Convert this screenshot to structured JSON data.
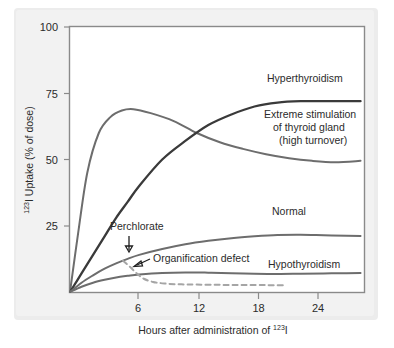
{
  "figure": {
    "background_color": "#f2f2f2",
    "plot_background_color": "#ffffff"
  },
  "chart_data": {
    "type": "line",
    "title": "",
    "xlabel_parts": {
      "pre": "Hours after administration of ",
      "sup": "123",
      "post": "I"
    },
    "ylabel_parts": {
      "sup": "123",
      "post": "I Uptake (% of dose)"
    },
    "xlabel": "Hours after administration of 123I",
    "ylabel": "123I Uptake (% of dose)",
    "xlim": [
      0,
      25.5
    ],
    "ylim": [
      0,
      100
    ],
    "xticks": [
      6,
      12,
      18,
      24
    ],
    "xtick_labels": [
      "6",
      "12",
      "18",
      "24"
    ],
    "yticks": [
      25,
      50,
      75,
      100
    ],
    "ytick_labels": [
      "25",
      "50",
      "75",
      "100"
    ],
    "grid": false,
    "legend": "inline-labels",
    "series": [
      {
        "name": "Hyperthyroidism",
        "label": "Hyperthyroidism",
        "color": "#3a3a3a",
        "style": "solid",
        "x": [
          0,
          1,
          2,
          3,
          4,
          5,
          6,
          8,
          10,
          12,
          14,
          16,
          18,
          20,
          22,
          24,
          25.2
        ],
        "values": [
          0,
          7,
          14,
          21,
          28,
          34,
          40,
          50,
          57,
          63,
          67,
          70,
          71.5,
          72,
          72,
          72,
          72
        ]
      },
      {
        "name": "Extreme stimulation of thyroid gland (high turnover)",
        "label_lines": [
          "Extreme stimulation",
          "of thyroid gland",
          "(high turnover)"
        ],
        "color": "#6d6d6d",
        "style": "solid",
        "x": [
          0,
          0.7,
          1.5,
          2.5,
          3.5,
          4.5,
          5.5,
          7,
          9,
          11,
          13,
          15,
          17,
          19,
          21,
          23,
          25.2
        ],
        "values": [
          0,
          22,
          45,
          60,
          66,
          68.5,
          69,
          67.5,
          64.5,
          60,
          56.5,
          54,
          52,
          50.5,
          49.5,
          49,
          49.5
        ]
      },
      {
        "name": "Normal",
        "label": "Normal",
        "color": "#6d6d6d",
        "style": "solid",
        "x": [
          0,
          1,
          2,
          3,
          4,
          5,
          6,
          8,
          10,
          12,
          14,
          16,
          18,
          20,
          22,
          24,
          25.2
        ],
        "values": [
          0,
          3.5,
          6.3,
          8.8,
          10.8,
          12.5,
          14,
          16.2,
          18,
          19.3,
          20.3,
          21,
          21.5,
          21.6,
          21.4,
          21.2,
          21.1
        ]
      },
      {
        "name": "Hypothyroidism",
        "label": "Hypothyroidism",
        "color": "#6d6d6d",
        "style": "solid",
        "x": [
          0,
          1,
          2,
          3,
          4,
          5,
          6,
          8,
          10,
          12,
          14,
          16,
          18,
          20,
          22,
          24,
          25.2
        ],
        "values": [
          0,
          2.0,
          3.5,
          4.6,
          5.5,
          6.1,
          6.6,
          7.2,
          7.4,
          7.3,
          7.1,
          6.9,
          6.8,
          6.9,
          7.0,
          7.1,
          7.2
        ]
      },
      {
        "name": "Organification defect",
        "label": "Organification defect",
        "color": "#a5a5a5",
        "style": "dashed",
        "note": "branches off Normal curve at perchlorate administration (~5 h) and falls to baseline",
        "x": [
          4.6,
          5.2,
          5.8,
          6.4,
          7.2,
          8.2,
          9.5,
          11,
          13,
          15,
          17,
          18.6
        ],
        "values": [
          11.8,
          9.5,
          7.0,
          5.0,
          3.8,
          3.2,
          2.9,
          2.8,
          2.7,
          2.6,
          2.6,
          2.5
        ]
      }
    ],
    "annotations": [
      {
        "name": "perchlorate",
        "text": "Perchlorate",
        "arrow": "down",
        "points_to_x": 5.0,
        "points_to_y": 13.0
      },
      {
        "name": "organification-defect",
        "text": "Organification defect",
        "arrow": "left",
        "points_to_x": 6.0,
        "points_to_y": 6.5
      }
    ]
  }
}
